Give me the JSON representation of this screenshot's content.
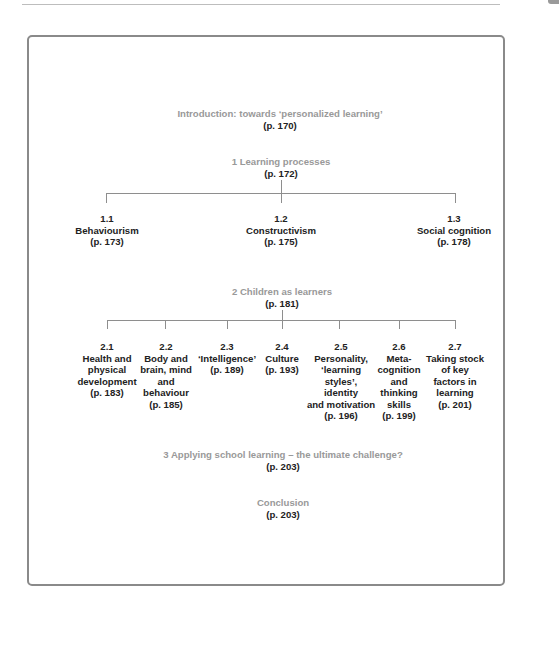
{
  "intro": {
    "title": "Introduction: towards ‘personalized learning’",
    "page": "(p. 170)"
  },
  "section1": {
    "title": "1  Learning processes",
    "page": "(p. 172)",
    "children": [
      {
        "num": "1.1",
        "lines": [
          "Behaviourism"
        ],
        "page": "(p. 173)"
      },
      {
        "num": "1.2",
        "lines": [
          "Constructivism"
        ],
        "page": "(p. 175)"
      },
      {
        "num": "1.3",
        "lines": [
          "Social cognition"
        ],
        "page": "(p. 178)"
      }
    ]
  },
  "section2": {
    "title": "2 Children as learners",
    "page": "(p. 181)",
    "children": [
      {
        "num": "2.1",
        "lines": [
          "Health and",
          "physical",
          "development"
        ],
        "page": "(p. 183)"
      },
      {
        "num": "2.2",
        "lines": [
          "Body and",
          "brain, mind",
          "and",
          "behaviour"
        ],
        "page": "(p. 185)"
      },
      {
        "num": "2.3",
        "lines": [
          "‘Intelligence’"
        ],
        "page": "(p. 189)"
      },
      {
        "num": "2.4",
        "lines": [
          "Culture"
        ],
        "page": "(p. 193)"
      },
      {
        "num": "2.5",
        "lines": [
          "Personality,",
          "‘learning",
          "styles’,",
          "identity",
          "and motivation"
        ],
        "page": "(p. 196)"
      },
      {
        "num": "2.6",
        "lines": [
          "Meta-",
          "cognition",
          "and",
          "thinking",
          "skills"
        ],
        "page": "(p. 199)"
      },
      {
        "num": "2.7",
        "lines": [
          "Taking stock",
          "of key",
          "factors in",
          "learning"
        ],
        "page": "(p. 201)"
      }
    ]
  },
  "section3": {
    "title": "3  Applying school learning – the ultimate challenge?",
    "page": "(p. 203)"
  },
  "conclusion": {
    "title": "Conclusion",
    "page": "(p. 203)"
  }
}
